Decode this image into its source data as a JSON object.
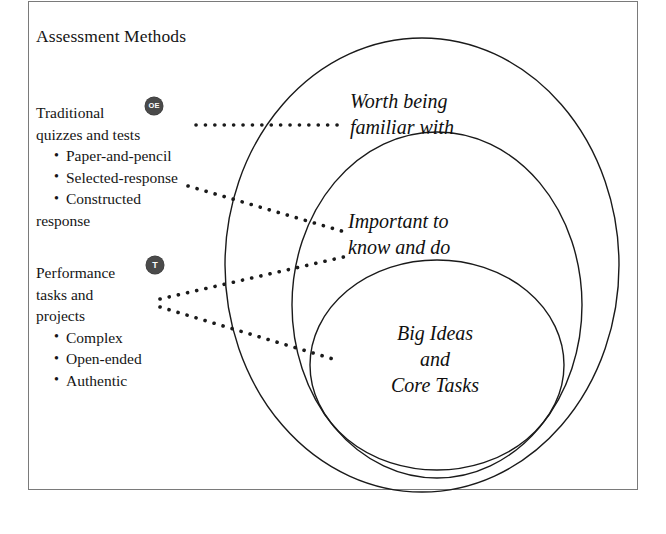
{
  "figure": {
    "title": "Assessment Methods",
    "background_color": "#ffffff",
    "frame_color": "#7a7a7a",
    "ink_color": "#151515"
  },
  "methods": [
    {
      "badge": "OE",
      "badge_color": "#4a4a4a",
      "heading_lines": [
        "Traditional",
        "quizzes and tests"
      ],
      "bullets": [
        "Paper-and-pencil",
        "Selected-response",
        "Constructed",
        "response"
      ]
    },
    {
      "badge": "T",
      "badge_color": "#4a4a4a",
      "heading_lines": [
        "Performance",
        "tasks and",
        "projects"
      ],
      "bullets": [
        "Complex",
        "Open-ended",
        "Authentic"
      ]
    }
  ],
  "circles": [
    {
      "name": "outer",
      "label_lines": [
        "Worth being",
        "familiar with"
      ]
    },
    {
      "name": "middle",
      "label_lines": [
        "Important to",
        "know and do"
      ]
    },
    {
      "name": "inner",
      "label_lines": [
        "Big Ideas",
        "and",
        "Core Tasks"
      ]
    }
  ],
  "connectors": [
    {
      "name": "oe-to-outer",
      "style": "dotted"
    },
    {
      "name": "oe-to-middle",
      "style": "dotted"
    },
    {
      "name": "t-to-middle",
      "style": "dotted"
    },
    {
      "name": "t-to-inner",
      "style": "dotted"
    }
  ]
}
